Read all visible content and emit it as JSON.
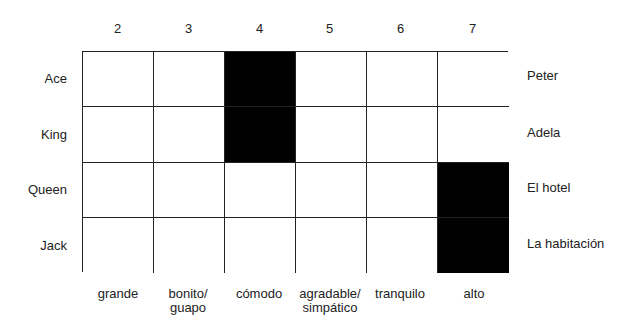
{
  "column_numbers": [
    "2",
    "3",
    "4",
    "5",
    "6",
    "7"
  ],
  "column_labels": [
    "grande",
    "bonito/\nguapo",
    "cómodo",
    "agradable/\nsimpático",
    "tranquilo",
    "alto"
  ],
  "row_labels_left": [
    "Ace",
    "King",
    "Queen",
    "Jack"
  ],
  "row_labels_right": [
    "Peter",
    "Adela",
    "El hotel",
    "La habitación"
  ],
  "filled_cells": [
    [
      0,
      2
    ],
    [
      1,
      2
    ],
    [
      2,
      5
    ],
    [
      3,
      5
    ]
  ],
  "colors": {
    "line": "#222222",
    "filled": "#000000",
    "background": "#ffffff"
  }
}
